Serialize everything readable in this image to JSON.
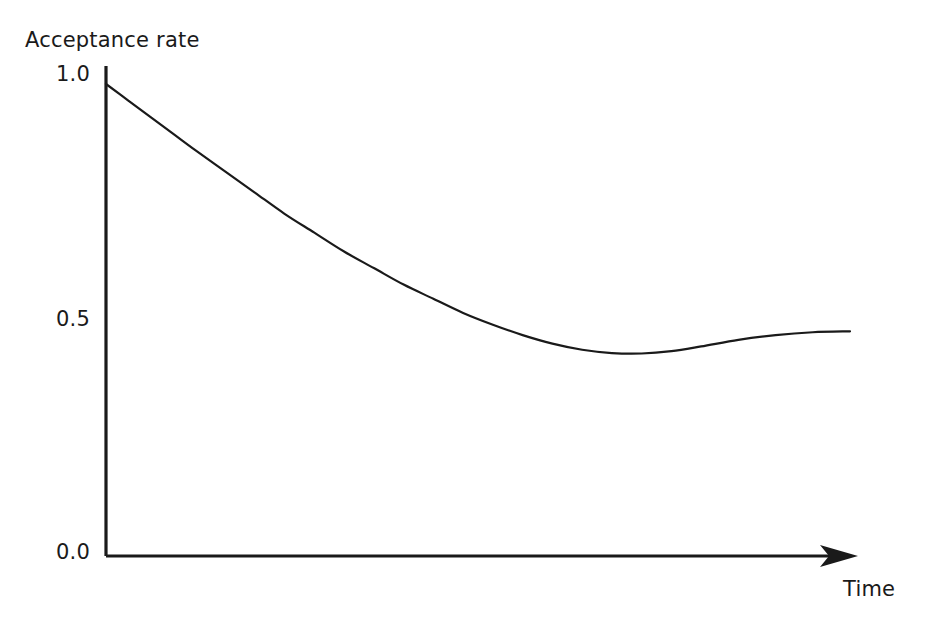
{
  "chart_data": {
    "type": "line",
    "title": "",
    "xlabel": "Time",
    "ylabel": "Acceptance rate",
    "ylim": [
      0.0,
      1.0
    ],
    "xlim": [
      0,
      1
    ],
    "grid": false,
    "legend": null,
    "y_ticks": [
      "1.0",
      "0.5",
      "0.0"
    ],
    "y_tick_values": [
      1.0,
      0.5,
      0.0
    ],
    "x_ticks": [],
    "axis_style": "open-l-shape-with-arrow",
    "series": [
      {
        "name": "Acceptance rate",
        "color": "#1a1a1a",
        "x": [
          0.0,
          0.03,
          0.06,
          0.09,
          0.12,
          0.16,
          0.2,
          0.24,
          0.28,
          0.32,
          0.36,
          0.4,
          0.44,
          0.48,
          0.52,
          0.56,
          0.6,
          0.64,
          0.68,
          0.72,
          0.76,
          0.8,
          0.85,
          0.9,
          0.95,
          1.0
        ],
        "y": [
          1.0,
          0.965,
          0.93,
          0.895,
          0.86,
          0.815,
          0.77,
          0.725,
          0.685,
          0.645,
          0.61,
          0.575,
          0.545,
          0.515,
          0.49,
          0.468,
          0.45,
          0.437,
          0.43,
          0.429,
          0.434,
          0.444,
          0.458,
          0.468,
          0.474,
          0.476
        ]
      }
    ],
    "annotations": {
      "start_value": 1.0,
      "minimum_value": 0.43,
      "final_plateau_value": 0.476
    }
  },
  "axes": {
    "y_axis_label": "Acceptance rate",
    "x_axis_label": "Time",
    "tick_1": "1.0",
    "tick_2": "0.5",
    "tick_3": "0.0"
  },
  "colors": {
    "background": "#ffffff",
    "ink": "#1a1a1a",
    "curve": "#2a2a2a"
  }
}
